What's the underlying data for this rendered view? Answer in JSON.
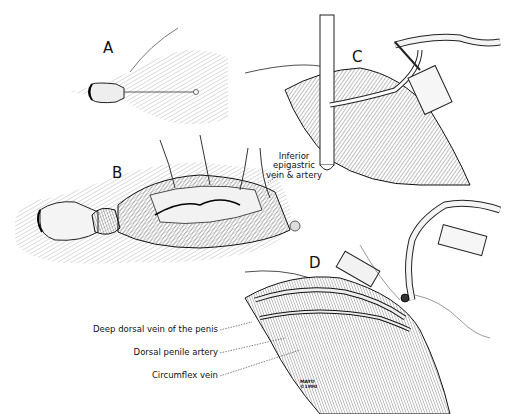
{
  "figure": {
    "panels": [
      {
        "id": "A",
        "label": "A"
      },
      {
        "id": "B",
        "label": "B"
      },
      {
        "id": "C",
        "label": "C"
      },
      {
        "id": "D",
        "label": "D"
      }
    ],
    "annotations": {
      "inferior_epigastric": {
        "line1": "Inferior",
        "line2": "epigastric",
        "line3": "vein & artery"
      },
      "deep_dorsal_vein": "Deep dorsal vein of the penis",
      "dorsal_penile_artery": "Dorsal penile artery",
      "circumflex_vein": "Circumflex vein"
    },
    "signature": {
      "line1": "MAYO",
      "line2": "©1990"
    }
  }
}
